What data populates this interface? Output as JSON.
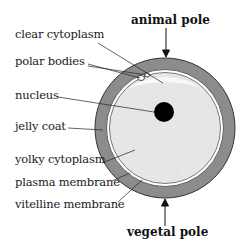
{
  "diagram": {
    "labels": {
      "clear_cytoplasm": "clear cytoplasm",
      "polar_bodies": "polar bodies",
      "nucleus": "nucleus",
      "jelly_coat": "jelly coat",
      "yolky_cytoplasm": "yolky cytoplasm",
      "plasma_membrane": "plasma membrane",
      "vitelline_membrane": "vitelline membrane"
    },
    "poles": {
      "top": "animal pole",
      "bottom": "vegetal pole"
    },
    "colors": {
      "jelly_coat": "#8a8a8a",
      "cytoplasm": "#efefef",
      "nucleus": "#000000",
      "lines": "#222222"
    }
  }
}
